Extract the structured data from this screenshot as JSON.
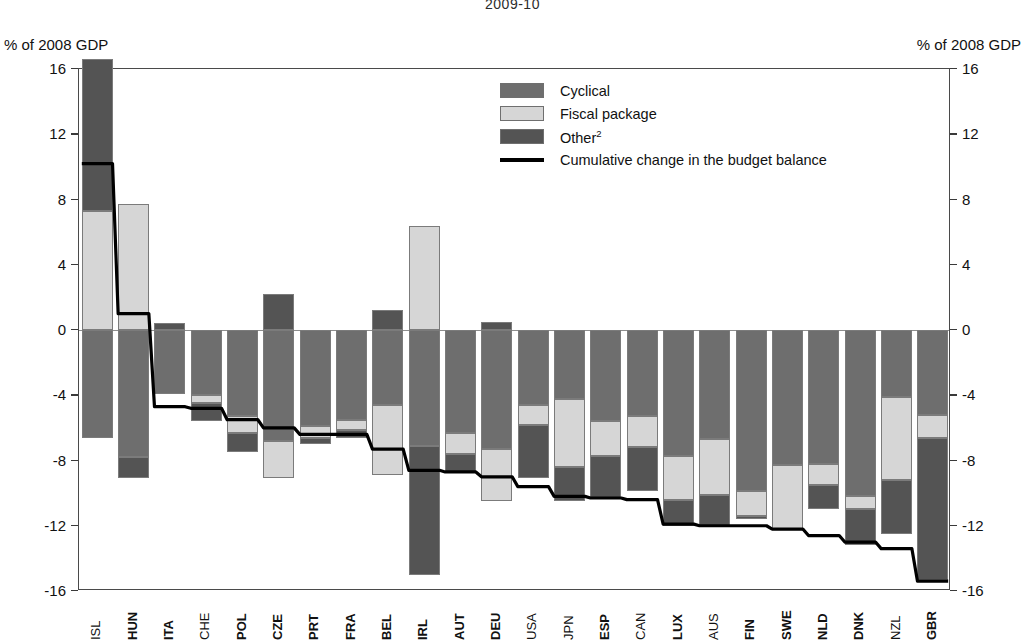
{
  "title_partial": "2009-10",
  "axis": {
    "unit_left": "% of 2008 GDP",
    "unit_right": "% of 2008 GDP",
    "ticks": [
      16,
      12,
      8,
      4,
      0,
      -4,
      -8,
      -12,
      -16
    ],
    "tick_labels": [
      "16",
      "12",
      "8",
      "4",
      "0",
      "-4",
      "-8",
      "-12",
      "-16"
    ]
  },
  "legend": {
    "items": [
      {
        "label": "Cyclical",
        "type": "swatch",
        "color": "#6e6e6e"
      },
      {
        "label": "Fiscal package",
        "type": "swatch",
        "color": "#d6d6d6"
      },
      {
        "label": "Other",
        "sup": "2",
        "type": "swatch",
        "color": "#545454"
      },
      {
        "label": "Cumulative change in the budget balance",
        "type": "line",
        "color": "#000000"
      }
    ]
  },
  "colors": {
    "cyclical": "#6e6e6e",
    "fiscal": "#d6d6d6",
    "other": "#545454",
    "line": "#000000",
    "frame": "#4a4a4a",
    "zero": "#8d8d8d"
  },
  "chart_data": {
    "type": "bar",
    "subtype": "stacked-bar-with-line",
    "title": "2009-10",
    "xlabel": "",
    "ylabel": "% of 2008 GDP",
    "ylim": [
      -16,
      16
    ],
    "ytick_step": 4,
    "grid": false,
    "legend_position": "upper-center-right",
    "categories": [
      "ISL",
      "HUN",
      "ITA",
      "CHE",
      "POL",
      "CZE",
      "PRT",
      "FRA",
      "BEL",
      "IRL",
      "AUT",
      "DEU",
      "USA",
      "JPN",
      "ESP",
      "CAN",
      "LUX",
      "AUS",
      "FIN",
      "SWE",
      "NLD",
      "DNK",
      "NZL",
      "GBR"
    ],
    "category_bold": [
      false,
      true,
      true,
      false,
      true,
      true,
      true,
      true,
      true,
      true,
      true,
      true,
      false,
      false,
      true,
      false,
      true,
      false,
      true,
      true,
      true,
      true,
      false,
      true
    ],
    "series": [
      {
        "name": "Cyclical",
        "values": [
          -6.6,
          -7.8,
          -3.9,
          -4.0,
          -5.3,
          -6.8,
          -5.9,
          -5.5,
          -4.6,
          -7.1,
          -6.3,
          -7.3,
          -4.6,
          -4.2,
          -5.6,
          -5.3,
          -7.7,
          -6.7,
          -9.9,
          -8.3,
          -8.2,
          -10.2,
          -4.1,
          -5.2
        ]
      },
      {
        "name": "Fiscal package",
        "values": [
          7.3,
          7.7,
          0.0,
          -0.5,
          -1.0,
          -2.3,
          -0.7,
          -0.6,
          -4.3,
          6.4,
          -1.3,
          -3.2,
          -1.2,
          -4.2,
          -2.1,
          -1.9,
          -2.7,
          -3.4,
          -1.5,
          -3.9,
          -1.3,
          -0.8,
          -5.1,
          -1.4
        ]
      },
      {
        "name": "Other",
        "values": [
          9.3,
          -1.3,
          0.4,
          -1.1,
          -1.2,
          2.2,
          -0.4,
          -0.5,
          1.2,
          -7.9,
          -1.1,
          0.5,
          -3.3,
          -2.1,
          -2.6,
          -2.7,
          -1.6,
          -1.9,
          -0.2,
          -0.1,
          -1.5,
          -2.2,
          -3.3,
          -8.7
        ]
      }
    ],
    "line_series": {
      "name": "Cumulative change in the budget balance",
      "values": [
        10.2,
        1.0,
        -4.7,
        -4.8,
        -5.5,
        -6.0,
        -6.4,
        -6.4,
        -7.3,
        -8.6,
        -8.7,
        -9.0,
        -9.6,
        -10.2,
        -10.3,
        -10.4,
        -11.9,
        -12.0,
        -12.0,
        -12.2,
        -12.6,
        -13.0,
        -13.4,
        -15.4
      ]
    }
  }
}
